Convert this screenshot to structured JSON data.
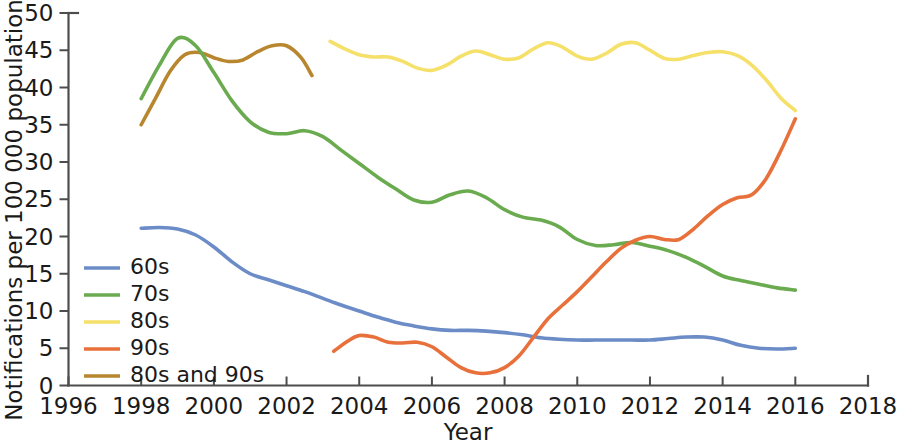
{
  "chart_data": {
    "type": "line",
    "title": "",
    "xlabel": "Year",
    "ylabel": "Notifications per 100 000 population n",
    "xlim": [
      1996,
      2018
    ],
    "ylim": [
      0,
      50
    ],
    "xticks": [
      "1996",
      "1998",
      "2000",
      "2002",
      "2004",
      "2006",
      "2008",
      "2010",
      "2012",
      "2014",
      "2016",
      "2018"
    ],
    "yticks": [
      "0",
      "5",
      "10",
      "15",
      "20",
      "25",
      "30",
      "35",
      "40",
      "45",
      "50"
    ],
    "grid": false,
    "legend_position": "inner-left",
    "series": [
      {
        "name": "60s",
        "color": "#6b8cc7",
        "x": [
          1998.0,
          1998.5,
          1999.0,
          1999.5,
          2000.0,
          2000.5,
          2001.0,
          2001.5,
          2002.0,
          2002.5,
          2003.0,
          2003.5,
          2004.0,
          2004.5,
          2005.0,
          2005.5,
          2006.0,
          2006.5,
          2007.0,
          2007.5,
          2008.0,
          2008.5,
          2009.0,
          2009.5,
          2010.0,
          2010.5,
          2011.0,
          2011.5,
          2012.0,
          2012.5,
          2013.0,
          2013.5,
          2014.0,
          2014.5,
          2015.0,
          2015.5,
          2016.0
        ],
        "values": [
          21.1,
          21.2,
          21.0,
          20.2,
          18.6,
          16.6,
          15.0,
          14.2,
          13.4,
          12.6,
          11.7,
          10.8,
          10.0,
          9.2,
          8.5,
          8.0,
          7.6,
          7.4,
          7.4,
          7.3,
          7.1,
          6.8,
          6.4,
          6.2,
          6.1,
          6.1,
          6.1,
          6.1,
          6.1,
          6.3,
          6.5,
          6.5,
          6.1,
          5.4,
          5.0,
          4.9,
          5.0
        ]
      },
      {
        "name": "70s",
        "color": "#6aab4f",
        "x": [
          1998.0,
          1998.5,
          1999.0,
          1999.5,
          2000.0,
          2000.5,
          2001.0,
          2001.5,
          2002.0,
          2002.5,
          2003.0,
          2003.5,
          2004.0,
          2004.5,
          2005.0,
          2005.5,
          2006.0,
          2006.5,
          2007.0,
          2007.5,
          2008.0,
          2008.5,
          2009.0,
          2009.5,
          2010.0,
          2010.5,
          2011.0,
          2011.5,
          2012.0,
          2012.5,
          2013.0,
          2013.5,
          2014.0,
          2014.5,
          2015.0,
          2015.5,
          2016.0
        ],
        "values": [
          38.5,
          43.0,
          46.6,
          45.6,
          42.0,
          38.2,
          35.4,
          34.0,
          33.8,
          34.2,
          33.4,
          31.6,
          29.8,
          28.0,
          26.4,
          24.9,
          24.6,
          25.6,
          26.1,
          25.2,
          23.6,
          22.6,
          22.2,
          21.3,
          19.6,
          18.8,
          18.9,
          19.2,
          18.7,
          18.1,
          17.2,
          16.0,
          14.7,
          14.1,
          13.6,
          13.1,
          12.8
        ]
      },
      {
        "name": "80s",
        "color": "#f5e06a",
        "x": [
          2003.2,
          2003.6,
          2004.0,
          2004.4,
          2004.8,
          2005.2,
          2005.6,
          2006.0,
          2006.4,
          2006.8,
          2007.2,
          2007.6,
          2008.0,
          2008.4,
          2008.8,
          2009.2,
          2009.6,
          2010.0,
          2010.4,
          2010.8,
          2011.2,
          2011.6,
          2012.0,
          2012.4,
          2012.8,
          2013.2,
          2013.6,
          2014.0,
          2014.4,
          2014.8,
          2015.2,
          2015.6,
          2016.0
        ],
        "values": [
          46.2,
          45.2,
          44.4,
          44.1,
          44.1,
          43.5,
          42.6,
          42.3,
          43.0,
          44.2,
          44.9,
          44.4,
          43.8,
          44.0,
          45.2,
          46.0,
          45.4,
          44.2,
          43.8,
          44.6,
          45.8,
          46.0,
          45.0,
          43.9,
          43.8,
          44.3,
          44.7,
          44.8,
          44.3,
          43.0,
          41.0,
          38.6,
          36.9
        ]
      },
      {
        "name": "90s",
        "color": "#e8703a",
        "x": [
          2003.3,
          2003.7,
          2004.0,
          2004.4,
          2004.8,
          2005.2,
          2005.6,
          2006.0,
          2006.4,
          2006.8,
          2007.2,
          2007.6,
          2008.0,
          2008.4,
          2008.8,
          2009.2,
          2009.6,
          2010.0,
          2010.4,
          2010.8,
          2011.2,
          2011.6,
          2012.0,
          2012.4,
          2012.8,
          2013.2,
          2013.6,
          2014.0,
          2014.4,
          2014.8,
          2015.2,
          2015.6,
          2016.0
        ],
        "values": [
          4.6,
          6.0,
          6.7,
          6.5,
          5.8,
          5.7,
          5.8,
          5.2,
          3.8,
          2.4,
          1.7,
          1.7,
          2.4,
          4.0,
          6.5,
          9.0,
          10.8,
          12.6,
          14.6,
          16.6,
          18.4,
          19.5,
          20.0,
          19.6,
          19.6,
          21.0,
          22.8,
          24.3,
          25.2,
          25.6,
          27.8,
          31.5,
          35.8
        ]
      },
      {
        "name": "80s and 90s",
        "color": "#b8862f",
        "x": [
          1998.0,
          1998.4,
          1998.8,
          1999.2,
          1999.6,
          2000.0,
          2000.4,
          2000.8,
          2001.2,
          2001.6,
          2002.0,
          2002.4,
          2002.7
        ],
        "values": [
          35.0,
          38.6,
          42.2,
          44.4,
          44.7,
          44.0,
          43.5,
          43.7,
          44.8,
          45.6,
          45.6,
          44.0,
          41.6
        ]
      }
    ]
  },
  "legend": {
    "items": [
      {
        "label": "60s",
        "color": "#6b8cc7"
      },
      {
        "label": "70s",
        "color": "#6aab4f"
      },
      {
        "label": "80s",
        "color": "#f5e06a"
      },
      {
        "label": "90s",
        "color": "#e8703a"
      },
      {
        "label": "80s and 90s",
        "color": "#b8862f"
      }
    ]
  }
}
